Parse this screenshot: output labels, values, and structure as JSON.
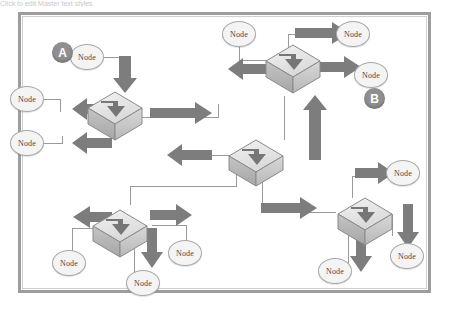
{
  "page": {
    "top_strip_text": "Click to edit Master text styles",
    "background_color": "#ffffff",
    "frame_color": "#9d9d9d"
  },
  "diagram": {
    "type": "network-topology",
    "node_label": "Node",
    "colors": {
      "arrow": "#7d7d7d",
      "connector_line": "#9a9a9a",
      "node_fill": "#f4f4f4",
      "node_stroke": "#a8a8a8",
      "badge_fill": "#8f8f8f",
      "badge_text": "#ffffff",
      "switch_top": "#e9e9e9",
      "switch_front": "#cfcfcf",
      "switch_side": "#b6b6b6",
      "switch_stroke": "#8a8a8a"
    },
    "badges": [
      {
        "id": "badge-a",
        "label": "A",
        "x": 52,
        "y": 42
      },
      {
        "id": "badge-b",
        "label": "B",
        "x": 364,
        "y": 88
      }
    ],
    "switches": [
      {
        "id": "switch-left",
        "x": 88,
        "y": 92
      },
      {
        "id": "switch-top-right",
        "x": 266,
        "y": 45
      },
      {
        "id": "switch-center",
        "x": 229,
        "y": 140
      },
      {
        "id": "switch-bottom-left",
        "x": 93,
        "y": 210
      },
      {
        "id": "switch-bottom-right",
        "x": 338,
        "y": 198
      }
    ],
    "nodes": [
      {
        "id": "node-a",
        "label": "Node",
        "x": 70,
        "y": 44
      },
      {
        "id": "node-left-upper",
        "label": "Node",
        "x": 10,
        "y": 86
      },
      {
        "id": "node-left-lower",
        "label": "Node",
        "x": 10,
        "y": 130
      },
      {
        "id": "node-top-center",
        "label": "Node",
        "x": 222,
        "y": 21
      },
      {
        "id": "node-top-right",
        "label": "Node",
        "x": 336,
        "y": 21
      },
      {
        "id": "node-right-upper",
        "label": "Node",
        "x": 354,
        "y": 62
      },
      {
        "id": "node-bl-left",
        "label": "Node",
        "x": 52,
        "y": 250
      },
      {
        "id": "node-bl-center",
        "label": "Node",
        "x": 126,
        "y": 270
      },
      {
        "id": "node-bl-right",
        "label": "Node",
        "x": 168,
        "y": 240
      },
      {
        "id": "node-br-top",
        "label": "Node",
        "x": 386,
        "y": 160
      },
      {
        "id": "node-br-right",
        "label": "Node",
        "x": 390,
        "y": 243
      },
      {
        "id": "node-br-left",
        "label": "Node",
        "x": 318,
        "y": 258
      }
    ]
  }
}
